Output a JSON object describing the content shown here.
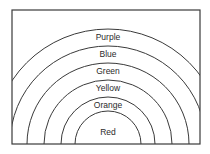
{
  "diagram": {
    "type": "concentric-arcs",
    "frame": {
      "x": 12,
      "y": 10,
      "width": 188,
      "height": 134
    },
    "center": {
      "x": 108,
      "y": 144
    },
    "bands": [
      {
        "label": "Purple",
        "radius": 115,
        "label_y": 40
      },
      {
        "label": "Blue",
        "radius": 98,
        "label_y": 57
      },
      {
        "label": "Green",
        "radius": 81,
        "label_y": 74
      },
      {
        "label": "Yellow",
        "radius": 64,
        "label_y": 91
      },
      {
        "label": "Orange",
        "radius": 47,
        "label_y": 108
      },
      {
        "label": "Red",
        "radius": 33,
        "label_y": 135
      }
    ],
    "stroke_color": "#3a3a3a",
    "text_color": "#2a2a2a"
  }
}
